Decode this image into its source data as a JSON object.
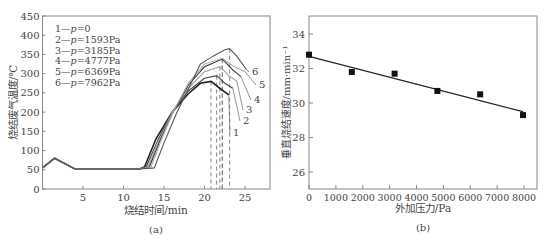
{
  "chart_data": [
    {
      "type": "line",
      "panel_label": "(a)",
      "title": "",
      "xlabel": "烧结时间/min",
      "ylabel": "烧结废气温度/℃",
      "xlim": [
        0,
        28
      ],
      "ylim": [
        0,
        450
      ],
      "xticks": [
        5,
        10,
        15,
        20,
        25
      ],
      "yticks": [
        0,
        50,
        100,
        150,
        200,
        250,
        300,
        350,
        400,
        450
      ],
      "grid": false,
      "legend_position": "upper-left",
      "legend": [
        "1—p=0",
        "2—p=1593Pa",
        "3—p=3185Pa",
        "4—p=4777Pa",
        "5—p=6369Pa",
        "6—p=7962Pa"
      ],
      "series": [
        {
          "name": "1—p=0",
          "label": "1",
          "peak_time": 20.8,
          "peak_temp": 280,
          "x": [
            0,
            1.5,
            4,
            8,
            12,
            12.6,
            14,
            16,
            18,
            19.5,
            20.8,
            22,
            23
          ],
          "y": [
            55,
            80,
            52,
            52,
            52,
            58,
            130,
            200,
            248,
            275,
            280,
            260,
            245
          ]
        },
        {
          "name": "2—p=1593Pa",
          "label": "2",
          "peak_time": 21.5,
          "peak_temp": 295,
          "x": [
            0,
            1.5,
            4,
            8,
            12,
            12.8,
            14.2,
            16,
            18,
            20,
            21.5,
            22.5,
            23.5
          ],
          "y": [
            55,
            80,
            52,
            52,
            52,
            58,
            125,
            200,
            255,
            288,
            295,
            275,
            262
          ]
        },
        {
          "name": "3—p=3185Pa",
          "label": "3",
          "peak_time": 21.9,
          "peak_temp": 318,
          "x": [
            0,
            1.5,
            4,
            8,
            12,
            13,
            14.5,
            16,
            18,
            20,
            21.9,
            23,
            24
          ],
          "y": [
            55,
            80,
            52,
            52,
            52,
            58,
            130,
            200,
            262,
            305,
            318,
            295,
            280
          ]
        },
        {
          "name": "4—p=4777Pa",
          "label": "4",
          "peak_time": 22.2,
          "peak_temp": 338,
          "x": [
            0,
            1.5,
            4,
            8,
            12,
            13.2,
            14.5,
            16,
            18,
            20,
            22.2,
            23.5,
            24.5
          ],
          "y": [
            55,
            80,
            52,
            52,
            52,
            58,
            125,
            195,
            270,
            318,
            338,
            310,
            292
          ]
        },
        {
          "name": "5—p=6369Pa",
          "label": "5",
          "peak_time": 22.2,
          "peak_temp": 340,
          "x": [
            0,
            1.5,
            4,
            8,
            12,
            13.4,
            14.7,
            16,
            18,
            20,
            22.2,
            23.5,
            25
          ],
          "y": [
            55,
            80,
            52,
            52,
            52,
            58,
            130,
            195,
            275,
            325,
            340,
            320,
            305
          ]
        },
        {
          "name": "6—p=7962Pa",
          "label": "6",
          "peak_time": 23.1,
          "peak_temp": 365,
          "x": [
            0,
            1.5,
            4,
            8,
            12,
            13.8,
            15,
            16.5,
            18,
            19.5,
            21,
            22.5,
            23.1,
            24,
            25.2
          ],
          "y": [
            55,
            80,
            52,
            52,
            52,
            55,
            120,
            195,
            260,
            325,
            345,
            362,
            365,
            345,
            310
          ]
        }
      ]
    },
    {
      "type": "scatter",
      "panel_label": "(b)",
      "title": "",
      "xlabel": "外加压力/Pa",
      "ylabel": "垂直烧结速度/mm·min⁻¹",
      "xlim": [
        0,
        8500
      ],
      "ylim": [
        25,
        35
      ],
      "xticks": [
        0,
        1000,
        2000,
        3000,
        4000,
        5000,
        6000,
        7000,
        8000
      ],
      "yticks": [
        26,
        28,
        30,
        32,
        34
      ],
      "grid": false,
      "series": [
        {
          "name": "measured",
          "marker": "square",
          "x": [
            0,
            1593,
            3185,
            4777,
            6369,
            7962
          ],
          "y": [
            32.8,
            31.8,
            31.7,
            30.7,
            30.5,
            29.3
          ]
        },
        {
          "name": "linear fit",
          "type": "line",
          "x": [
            0,
            7962
          ],
          "y": [
            32.7,
            29.5
          ]
        }
      ]
    }
  ],
  "labels": {
    "a": "(a)",
    "b": "(b)"
  }
}
